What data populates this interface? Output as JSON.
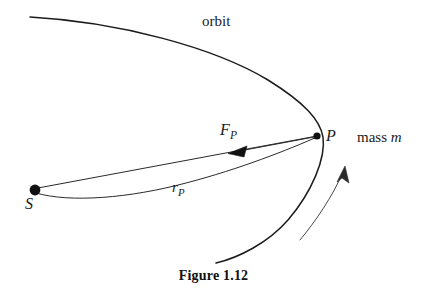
{
  "figure": {
    "caption": "Figure 1.12",
    "labels": {
      "orbit": "orbit",
      "point_P": "P",
      "mass_prefix": "mass ",
      "mass_symbol": "m",
      "center_S": "S",
      "force_symbol": "F",
      "force_subscript": "P",
      "radius_symbol": "r",
      "radius_subscript": "P"
    },
    "colors": {
      "ink": "#1a1a1a",
      "background": "#ffffff",
      "curve": "#1c1c1c",
      "thin_curve": "#4a4a4a"
    },
    "geometry": {
      "focus_S": {
        "x": 35,
        "y": 190,
        "r": 5.4
      },
      "point_P": {
        "x": 317,
        "y": 136,
        "r": 3.6
      },
      "orbit_path": "M 30,17 C 120,22 215,48 268,80 C 305,103 320,120 323,137 C 326,158 312,192 288,220 C 268,243 238,258 216,263",
      "radius_line_upper": "M 38,188 L 317,136",
      "radius_line_lower": "M 36,193 C 70,203 130,198 186,183 C 240,169 290,149 317,137",
      "force_arrow_line": "M 314,137 L 234,152",
      "force_arrow_head": "M 228,153.5 L 247,146 L 244,157 Z",
      "motion_arc": "M 300,240 C 315,222 333,196 343,172",
      "motion_arrow_head": "M 345,166 L 349,183 L 342,178 L 337,182 Z"
    },
    "description": {
      "type": "orbital-mechanics-diagram",
      "elements": [
        "parabolic orbit curve",
        "focus S with filled dot",
        "orbiting point P with filled dot",
        "radius vector r_P from S to P",
        "force vector F_P from P toward S",
        "direction-of-motion arc arrow"
      ]
    }
  }
}
